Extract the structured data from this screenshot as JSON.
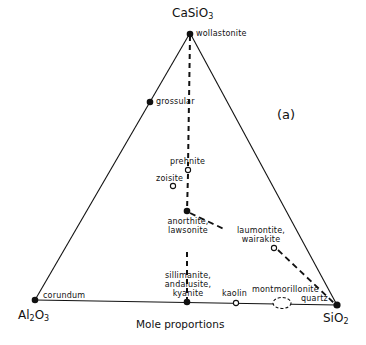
{
  "diagram": {
    "panel_label": "(a)",
    "axis_label": "Mole proportions",
    "vertices": {
      "top": {
        "formula": "CaSiO",
        "sub": "3"
      },
      "bottom_left": {
        "formula_a": "Al",
        "sub_a": "2",
        "formula_b": "O",
        "sub_b": "3"
      },
      "bottom_right": {
        "formula": "SiO",
        "sub": "2"
      }
    },
    "minerals": {
      "wollastonite": "wollastonite",
      "grossular": "grossular",
      "prehnite": "prehnite",
      "zoisite": "zoisite",
      "anorthite": "anorthite,",
      "lawsonite": "lawsonite",
      "laumontite": "laumontite,",
      "wairakite": "wairakite",
      "sillimanite": "sillimanite,",
      "andalusite": "andalusite,",
      "kyanite": "kyanite",
      "kaolin": "kaolin",
      "montmorillonite": "montmorillonite",
      "quartz": "quartz",
      "corundum": "corundum"
    },
    "point_styles": {
      "filled": [
        "wollastonite",
        "grossular",
        "anorthite-lawsonite",
        "sillimanite-andalusite-kyanite",
        "corundum",
        "quartz"
      ],
      "open": [
        "prehnite",
        "zoisite",
        "laumontite-wairakite",
        "kaolin"
      ],
      "dashed_field": [
        "montmorillonite"
      ]
    }
  }
}
